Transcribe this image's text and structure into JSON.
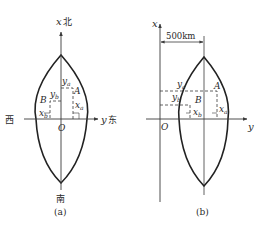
{
  "panel_a": {
    "caption": "(a)",
    "x_axis_label": "x",
    "north": "北",
    "south": "南",
    "west": "西",
    "y_axis_label": "y",
    "east": "东",
    "origin": "O",
    "point_a": "A",
    "point_b": "B",
    "ya": "y",
    "ya_sub": "a",
    "yb": "y",
    "yb_sub": "b",
    "xa": "x",
    "xa_sub": "a",
    "xb": "x",
    "xb_sub": "b"
  },
  "panel_b": {
    "caption": "(b)",
    "x_axis_label": "x",
    "y_axis_label": "y",
    "origin": "O",
    "offset_label": "500km",
    "point_a": "A",
    "point_b": "B",
    "ya": "y",
    "ya_sub": "a",
    "yb": "y",
    "yb_sub": "b",
    "xa": "x",
    "xa_sub": "a",
    "xb": "x",
    "xb_sub": "b"
  },
  "colors": {
    "line": "#3a3a3a",
    "curve": "#222222",
    "background": "#ffffff"
  }
}
